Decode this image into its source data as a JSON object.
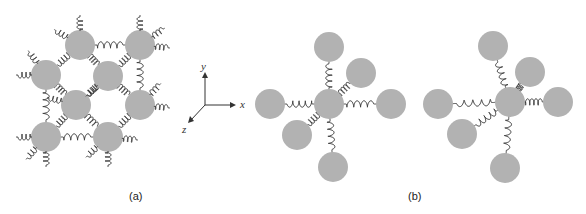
{
  "figure": {
    "bead_color": "#b2b2b2",
    "spring_color": "#2a2a2a",
    "panel_a": {
      "label": "(a)",
      "beads": [
        {
          "x": 80,
          "y": 45
        },
        {
          "x": 140,
          "y": 45
        },
        {
          "x": 46,
          "y": 75
        },
        {
          "x": 108,
          "y": 76
        },
        {
          "x": 76,
          "y": 105
        },
        {
          "x": 140,
          "y": 105
        },
        {
          "x": 46,
          "y": 137
        },
        {
          "x": 108,
          "y": 137
        }
      ]
    },
    "axes": {
      "x_label": "x",
      "y_label": "y",
      "z_label": "z"
    },
    "panel_b": {
      "label": "(b)",
      "left_cluster": {
        "center": {
          "x": 329,
          "y": 104
        },
        "neighbors": [
          {
            "x": 270,
            "y": 104
          },
          {
            "x": 391,
            "y": 104
          },
          {
            "x": 329,
            "y": 47
          },
          {
            "x": 361,
            "y": 73
          },
          {
            "x": 297,
            "y": 135
          },
          {
            "x": 333,
            "y": 167
          }
        ]
      },
      "right_cluster": {
        "center": {
          "x": 510,
          "y": 102
        },
        "neighbors": [
          {
            "x": 438,
            "y": 104
          },
          {
            "x": 558,
            "y": 102
          },
          {
            "x": 493,
            "y": 46
          },
          {
            "x": 530,
            "y": 72
          },
          {
            "x": 462,
            "y": 134
          },
          {
            "x": 505,
            "y": 168
          }
        ]
      }
    }
  }
}
